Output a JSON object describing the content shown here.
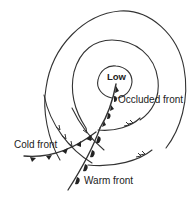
{
  "diagram": {
    "labels": {
      "low": "Low",
      "occluded_front": "Occluded front",
      "cold_front": "Cold front",
      "warm_front": "Warm front"
    },
    "elements": {
      "isobars": 3,
      "airflow_arrows": [
        "cold-air-flow",
        "warm-air-flow-upper",
        "warm-air-flow-lower"
      ]
    },
    "colors": {
      "line": "#333333",
      "background": "#ffffff"
    }
  }
}
